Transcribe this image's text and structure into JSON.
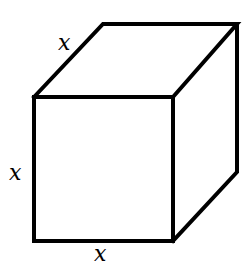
{
  "diagram": {
    "type": "cube",
    "colors": {
      "stroke": "#000000",
      "background": "#ffffff"
    },
    "labels": {
      "top_edge": "x",
      "left_edge": "x",
      "bottom_edge": "x"
    }
  }
}
